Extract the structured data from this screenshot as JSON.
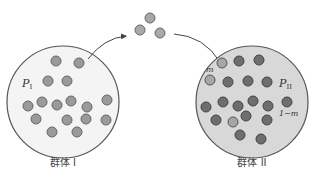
{
  "colors": {
    "background": "#ffffff",
    "population_1_fill": "#f2f2f2",
    "population_2_fill": "#d6d6d6",
    "outline": "#555555",
    "dot_light": "#a8a8a8",
    "dot_medium": "#8f8f8f",
    "dot_dark": "#6b6b6b",
    "dot_migrant": "#b3b3b3",
    "arrow": "#444444"
  },
  "population_1": {
    "label": "群体 I",
    "frequency_label": "P",
    "frequency_subscript": "I",
    "dot_count": 16
  },
  "population_2": {
    "label": "群体 II",
    "frequency_label": "P",
    "frequency_subscript": "II",
    "migrant_fraction_label": "m",
    "resident_fraction_label": "1−m",
    "dot_count": 19
  },
  "migrants": {
    "dot_count": 3
  }
}
